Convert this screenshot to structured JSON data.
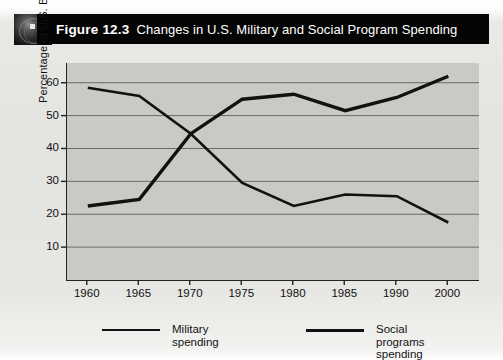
{
  "figure": {
    "number": "Figure 12.3",
    "title": "Changes in U.S. Military and Social Program Spending",
    "icon": "globe-icon"
  },
  "colors": {
    "header_bar": "#050505",
    "header_text": "#ffffff",
    "plot_background": "#c9c9c6",
    "gridline": "#6a6a67",
    "axis": "#222222",
    "series_line": "#111111",
    "page_background": "#e4e4e1"
  },
  "chart_data": {
    "type": "line",
    "title": "Changes in U.S. Military and Social Program Spending",
    "xlabel": "",
    "ylabel": "Percentage of U.S. Budget",
    "x": [
      1960,
      1965,
      1970,
      1975,
      1980,
      1985,
      1990,
      2000
    ],
    "x_tick_labels": [
      "1960",
      "1965",
      "1970",
      "1975",
      "1980",
      "1985",
      "1990",
      "2000"
    ],
    "y_ticks": [
      10,
      20,
      30,
      40,
      50,
      60
    ],
    "y_tick_labels": [
      "10",
      "20",
      "30",
      "40",
      "50",
      "60"
    ],
    "ylim": [
      0,
      66
    ],
    "grid": true,
    "legend_position": "bottom",
    "series": [
      {
        "name": "Military spending",
        "values": [
          58.5,
          56,
          44.5,
          29.5,
          22.5,
          26,
          25.5,
          17.5
        ],
        "line_width": 2.6
      },
      {
        "name": "Social programs spending",
        "values": [
          22.5,
          24.5,
          44.5,
          55,
          56.5,
          51.5,
          55.5,
          62
        ],
        "line_width": 3.4
      }
    ]
  },
  "legend": {
    "items": [
      {
        "label": "Military spending",
        "line_width": 2.2
      },
      {
        "label": "Social programs spending",
        "label_line1": "Social programs",
        "label_line2": "spending",
        "line_width": 3.4
      }
    ]
  }
}
